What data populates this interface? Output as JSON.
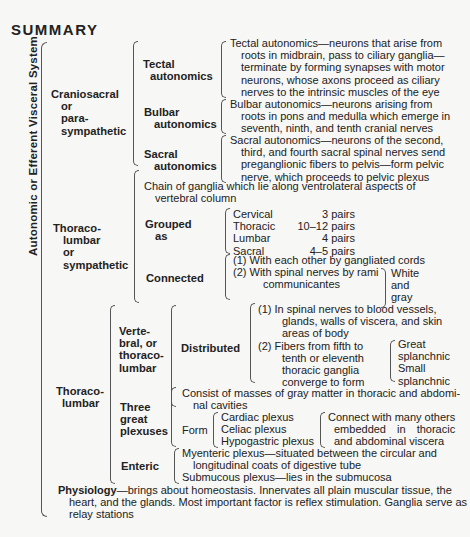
{
  "title": "SUMMARY",
  "root_label": "Autonomic or Efferent Visceral System",
  "craniosacral": {
    "label": [
      "Craniosacral",
      "or",
      "para-",
      "sympathetic"
    ],
    "tectal": {
      "label": [
        "Tectal",
        "autonomics"
      ],
      "text": [
        "Tectal autonomics—neurons that arise from",
        "roots in midbrain, pass to ciliary ganglia—",
        "terminate by forming synapses with motor",
        "neurons, whose axons proceed as ciliary",
        "nerves to the intrinsic muscles of the eye"
      ]
    },
    "bulbar": {
      "label": [
        "Bulbar",
        "autonomics"
      ],
      "text": [
        "Bulbar autonomics—neurons arising from",
        "roots in pons and medulla which emerge in",
        "seventh, ninth, and tenth cranial nerves"
      ]
    },
    "sacral": {
      "label": [
        "Sacral",
        "autonomics"
      ],
      "text": [
        "Sacral autonomics—neurons of the second,",
        "third, and fourth sacral spinal nerves send",
        "preganglionic fibers to pelvis—form pelvic",
        "nerve, which proceeds to pelvic plexus"
      ]
    }
  },
  "thoracolumbar_sympathetic": {
    "label": [
      "Thoraco-",
      "lumbar",
      "or",
      "sympathetic"
    ],
    "chain": [
      "Chain of ganglia which lie along ventrolateral aspects of",
      "vertebral column"
    ],
    "grouped": {
      "label": [
        "Grouped",
        "as"
      ],
      "rows": [
        {
          "region": "Cervical",
          "count": "3 pairs"
        },
        {
          "region": "Thoracic",
          "count": "10–12 pairs"
        },
        {
          "region": "Lumbar",
          "count": "4 pairs"
        },
        {
          "region": "Sacral",
          "count": "4–5 pairs"
        }
      ]
    },
    "connected": {
      "label": "Connected",
      "item1": "(1) With each other by gangliated cords",
      "item2": [
        "(2) With spinal nerves by rami",
        "communicantes"
      ],
      "types": [
        "White",
        "and",
        "gray"
      ]
    }
  },
  "thoracolumbar": {
    "label": [
      "Thoraco-",
      "lumbar"
    ],
    "vertebral": {
      "label": [
        "Verte-",
        "bral, or",
        "thoraco-",
        "lumbar"
      ],
      "distributed_label": "Distributed",
      "item1": [
        "(1) In spinal nerves to blood vessels,",
        "glands, walls of viscera, and skin",
        "areas of body"
      ],
      "item2": [
        "(2) Fibers from fifth to",
        "tenth or eleventh",
        "thoracic ganglia",
        "converge to form"
      ],
      "splanchnic": [
        "Great",
        "splanchnic",
        "Small",
        "splanchnic"
      ]
    },
    "plexuses": {
      "label": [
        "Three",
        "great",
        "plexuses"
      ],
      "consist": [
        "Consist of masses of gray matter in thoracic and abdomi-",
        "nal cavities"
      ],
      "form_label": "Form",
      "forms": [
        "Cardiac plexus",
        "Celiac plexus",
        "Hypogastric plexus"
      ],
      "connect": [
        "Connect with many others",
        "embedded in thoracic",
        "and abdominal viscera"
      ]
    },
    "enteric": {
      "label": "Enteric",
      "myenteric": [
        "Myenteric plexus—situated between the circular and",
        "longitudinal coats of digestive tube"
      ],
      "submucous": "Submucous plexus—lies in the submucosa"
    }
  },
  "physiology": {
    "label": "Physiology",
    "text": [
      "—brings about homeostasis. Innervates all plain muscular tissue, the",
      "heart, and the glands. Most important factor is reflex stimulation. Ganglia serve as",
      "relay stations"
    ]
  }
}
